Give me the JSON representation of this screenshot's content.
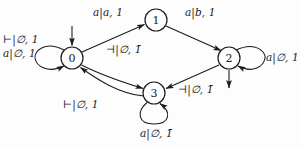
{
  "figure": {
    "type": "state-transition-diagram",
    "background_color": "#fdfdfd",
    "stroke_color": "#1c1c1c",
    "width": 302,
    "height": 147
  },
  "states": [
    {
      "id": "0",
      "label": "0",
      "cx": 72,
      "cy": 58,
      "r": 11,
      "is_initial": true,
      "initial_arrow": "from-top"
    },
    {
      "id": "1",
      "label": "1",
      "cx": 156,
      "cy": 20,
      "r": 11,
      "is_initial": false,
      "initial_arrow": ""
    },
    {
      "id": "2",
      "label": "2",
      "cx": 229,
      "cy": 58,
      "r": 11,
      "is_initial": false,
      "initial_arrow": "exit-bottom"
    },
    {
      "id": "3",
      "label": "3",
      "cx": 154,
      "cy": 93,
      "r": 11,
      "is_initial": false,
      "initial_arrow": ""
    }
  ],
  "edges": [
    {
      "name": "edge-0-to-1",
      "from": "0",
      "to": "1",
      "kind": "line",
      "label_prefix": "a",
      "label_mid": "a",
      "label_suffix": "1",
      "overbar": false
    },
    {
      "name": "edge-1-to-2",
      "from": "1",
      "to": "2",
      "kind": "line",
      "label_prefix": "a",
      "label_mid": "b",
      "label_suffix": "1",
      "overbar": false
    },
    {
      "name": "edge-0-to-3",
      "from": "0",
      "to": "3",
      "kind": "curve",
      "label_prefix": "⊣",
      "label_mid": "∅",
      "label_suffix": "1",
      "overbar": true
    },
    {
      "name": "edge-3-to-0",
      "from": "3",
      "to": "0",
      "kind": "curve",
      "label_prefix": "⊢",
      "label_mid": "∅",
      "label_suffix": "1",
      "overbar": false
    },
    {
      "name": "edge-2-to-3",
      "from": "2",
      "to": "3",
      "kind": "line",
      "label_prefix": "⊣",
      "label_mid": "∅",
      "label_suffix": "1",
      "overbar": true
    },
    {
      "name": "self-loop-0",
      "from": "0",
      "to": "0",
      "kind": "self-loop",
      "label_prefix": "⊢",
      "label_mid": "∅",
      "label_suffix": "1",
      "overbar": false
    },
    {
      "name": "self-loop-0-b",
      "from": "0",
      "to": "0",
      "kind": "self-loop",
      "label_prefix": "a",
      "label_mid": "∅",
      "label_suffix": "1",
      "overbar": false
    },
    {
      "name": "self-loop-2",
      "from": "2",
      "to": "2",
      "kind": "self-loop",
      "label_prefix": "a",
      "label_mid": "∅",
      "label_suffix": "1",
      "overbar": false
    },
    {
      "name": "self-loop-3",
      "from": "3",
      "to": "3",
      "kind": "self-loop",
      "label_prefix": "a",
      "label_mid": "∅",
      "label_suffix": "1",
      "overbar": true
    }
  ],
  "labels": {
    "top_left_edge": {
      "text": "a|a, 1",
      "x": 93,
      "y": 12
    },
    "top_right_edge": {
      "text": "a|b, 1",
      "x": 185,
      "y": 12
    },
    "zero_loop_upper": {
      "text": "⊢|∅, 1",
      "x": 3,
      "y": 38
    },
    "zero_loop_lower": {
      "text": "a|∅, 1",
      "x": 3,
      "y": 52
    },
    "center_edge": {
      "text": "⊣|∅, 1̄",
      "x": 106,
      "y": 48
    },
    "two_loop": {
      "text": "a|∅, 1",
      "x": 266,
      "y": 50
    },
    "two_to_three": {
      "text": "⊣|∅, 1̄",
      "x": 178,
      "y": 88
    },
    "three_to_zero": {
      "text": "⊢|∅, 1",
      "x": 63,
      "y": 103
    },
    "three_loop": {
      "text": "a|∅, 1̄",
      "x": 140,
      "y": 130
    }
  }
}
